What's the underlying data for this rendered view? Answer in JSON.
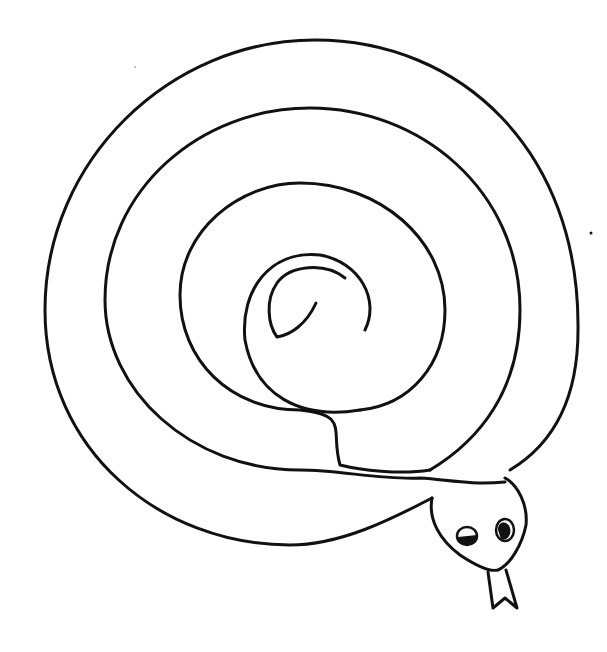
{
  "drawing": {
    "subject": "Coiled spiral snake line drawing",
    "stroke_color": "#111111",
    "background_color": "#ffffff",
    "parts": [
      "spiral-body",
      "head",
      "left-eye",
      "right-eye",
      "forked-tongue"
    ]
  }
}
